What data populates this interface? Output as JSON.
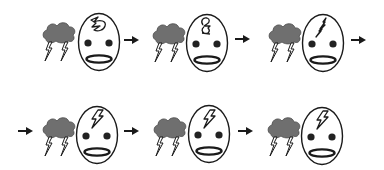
{
  "figure": {
    "colors": {
      "cloud_fill": "#6f6f6f",
      "cloud_stroke": "#4a4a4a",
      "line": "#1a1a1a",
      "background": "#ffffff"
    },
    "rows": [
      {
        "leading_arrow": false,
        "trailing_arrow": true,
        "panels": [
          {
            "id": 1,
            "cloud": "storm-cloud",
            "bolts": 2,
            "thought": "scribbled-bolt-fragment",
            "x": 42,
            "y": 13
          },
          {
            "id": 2,
            "cloud": "storm-cloud",
            "bolts": 2,
            "thought": "bolt-forming-figure-8",
            "x": 152,
            "y": 14
          },
          {
            "id": 3,
            "cloud": "storm-cloud",
            "bolts": 2,
            "thought": "thin-bolt",
            "x": 268,
            "y": 14
          }
        ]
      },
      {
        "leading_arrow": true,
        "trailing_arrow": false,
        "panels": [
          {
            "id": 4,
            "cloud": "storm-cloud",
            "bolts": 2,
            "thought": "full-bolt",
            "x": 42,
            "y": 106
          },
          {
            "id": 5,
            "cloud": "storm-cloud",
            "bolts": 2,
            "thought": "full-bolt",
            "x": 153,
            "y": 105
          },
          {
            "id": 6,
            "cloud": "storm-cloud",
            "bolts": 2,
            "thought": "full-bolt",
            "x": 267,
            "y": 107
          }
        ]
      }
    ],
    "arrows": [
      {
        "id": "a1",
        "icon": "arrow-right-icon",
        "x": 124,
        "y": 35
      },
      {
        "id": "a2",
        "icon": "arrow-right-icon",
        "x": 235,
        "y": 34
      },
      {
        "id": "a3",
        "icon": "arrow-right-icon",
        "x": 351,
        "y": 35
      },
      {
        "id": "a4",
        "icon": "arrow-right-icon",
        "x": 18,
        "y": 126
      },
      {
        "id": "a5",
        "icon": "arrow-right-icon",
        "x": 124,
        "y": 126
      },
      {
        "id": "a6",
        "icon": "arrow-right-icon",
        "x": 238,
        "y": 126
      }
    ]
  }
}
